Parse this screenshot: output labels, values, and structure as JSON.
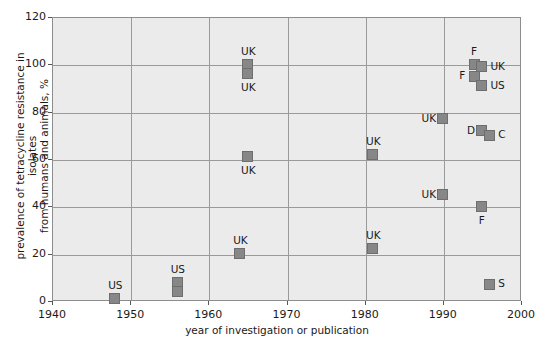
{
  "chart_data": {
    "type": "scatter",
    "title": "",
    "xlabel": "year of investigation or publication",
    "ylabel": "prevalence of tetracycline resistance in isolates from humans and animals, %",
    "ylabel_line1": "prevalence of tetracycline resistance in isolates",
    "ylabel_line2": "from humans and animals, %",
    "xlim": [
      1940,
      2000
    ],
    "ylim": [
      0,
      120
    ],
    "xticks": [
      1940,
      1950,
      1960,
      1970,
      1980,
      1990,
      2000
    ],
    "xtick_labels": [
      "1940",
      "1950",
      "1960",
      "1970",
      "1980",
      "1990",
      "2000"
    ],
    "yticks": [
      0,
      20,
      40,
      60,
      80,
      100,
      120
    ],
    "ytick_labels": [
      "0",
      "20",
      "40",
      "60",
      "80",
      "100",
      "120"
    ],
    "grid": true,
    "legend": "none",
    "marker_color": "#878787",
    "plot_background": "#ebebeb",
    "points": [
      {
        "label": "US",
        "x": 1948,
        "y": 1,
        "label_pos": "above"
      },
      {
        "label": "US",
        "x": 1956,
        "y": 8,
        "label_pos": "above"
      },
      {
        "label": "",
        "x": 1956,
        "y": 4,
        "label_pos": "none"
      },
      {
        "label": "UK",
        "x": 1964,
        "y": 20,
        "label_pos": "above"
      },
      {
        "label": "UK",
        "x": 1965,
        "y": 61,
        "label_pos": "below"
      },
      {
        "label": "UK",
        "x": 1965,
        "y": 100,
        "label_pos": "above"
      },
      {
        "label": "UK",
        "x": 1965,
        "y": 96,
        "label_pos": "below"
      },
      {
        "label": "UK",
        "x": 1981,
        "y": 22,
        "label_pos": "above"
      },
      {
        "label": "UK",
        "x": 1981,
        "y": 62,
        "label_pos": "above"
      },
      {
        "label": "UK",
        "x": 1990,
        "y": 77,
        "label_pos": "left"
      },
      {
        "label": "UK",
        "x": 1990,
        "y": 45,
        "label_pos": "left"
      },
      {
        "label": "F",
        "x": 1994,
        "y": 100,
        "label_pos": "above"
      },
      {
        "label": "UK",
        "x": 1995,
        "y": 99,
        "label_pos": "right"
      },
      {
        "label": "F",
        "x": 1994,
        "y": 95,
        "label_pos": "left"
      },
      {
        "label": "US",
        "x": 1995,
        "y": 91,
        "label_pos": "right"
      },
      {
        "label": "D",
        "x": 1995,
        "y": 72,
        "label_pos": "left"
      },
      {
        "label": "C",
        "x": 1996,
        "y": 70,
        "label_pos": "right"
      },
      {
        "label": "F",
        "x": 1995,
        "y": 40,
        "label_pos": "below"
      },
      {
        "label": "S",
        "x": 1996,
        "y": 7,
        "label_pos": "right"
      }
    ]
  }
}
